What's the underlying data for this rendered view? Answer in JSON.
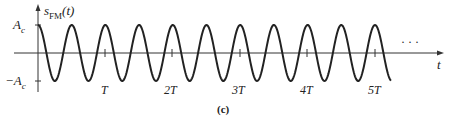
{
  "figure": {
    "y_label": "s",
    "y_label_sub": "FM",
    "y_label_arg": "(t)",
    "x_label": "t",
    "pos_amp_label": "A",
    "pos_amp_sub": "c",
    "neg_amp_label": "−A",
    "neg_amp_sub": "c",
    "ticks": [
      "T",
      "2T",
      "3T",
      "4T",
      "5T"
    ],
    "ellipsis": "· · ·",
    "caption": "(c)",
    "line_color": "#222222"
  },
  "chart_data": {
    "type": "line",
    "xlabel": "t",
    "ylabel": "s_FM(t)",
    "x_ticks": [
      "T",
      "2T",
      "3T",
      "4T",
      "5T"
    ],
    "y_ticks": [
      "A_c",
      "-A_c"
    ],
    "waveform": "cosine, constant amplitude A_c, 2 cycles per T",
    "x_range_T": [
      0,
      5.4
    ],
    "ylim": [
      "-A_c",
      "A_c"
    ],
    "caption": "(c)"
  }
}
